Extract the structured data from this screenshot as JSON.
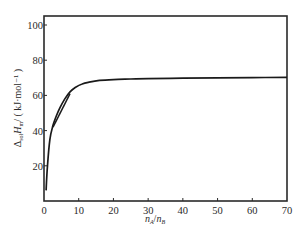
{
  "chart_data": {
    "type": "line",
    "title": "",
    "xlabel": "n_A/n_B",
    "ylabel": "Δ_sol H_m / (kJ·mol⁻¹)",
    "xlim": [
      0,
      70
    ],
    "ylim": [
      0,
      105
    ],
    "x_ticks": [
      0,
      10,
      20,
      30,
      40,
      50,
      60,
      70
    ],
    "y_ticks": [
      20,
      40,
      60,
      80,
      100
    ],
    "grid": false,
    "legend": null,
    "series": [
      {
        "name": "integral enthalpy of solution",
        "x": [
          0.6,
          1.0,
          1.7,
          2.6,
          3.5,
          4.6,
          6.0,
          7.5,
          9.0,
          11.0,
          13.0,
          16.0,
          20.0,
          25.0,
          30.0,
          40.0,
          50.0,
          60.0,
          70.0
        ],
        "y": [
          6,
          20,
          35,
          43,
          48,
          53,
          58,
          62,
          64.5,
          66.5,
          67.5,
          68.5,
          69.0,
          69.3,
          69.5,
          69.8,
          70.0,
          70.1,
          70.3
        ]
      }
    ],
    "annotations": [
      {
        "type": "tangent-line",
        "x": [
          2.6,
          7.5
        ],
        "y": [
          42,
          61
        ]
      }
    ]
  },
  "labels": {
    "x_axis_main": "n",
    "x_axis_sub_a": "A",
    "x_axis_slash": "/",
    "x_axis_sub_b": "B",
    "y_axis_delta": "Δ",
    "y_axis_sub_sol": "sol",
    "y_axis_h": "H",
    "y_axis_sub_m": "m",
    "y_axis_unit": "/ ( kJ·mol⁻¹ )"
  },
  "colors": {
    "line": "#1a1a1a",
    "axis": "#2a2a2a",
    "background": "#ffffff"
  }
}
